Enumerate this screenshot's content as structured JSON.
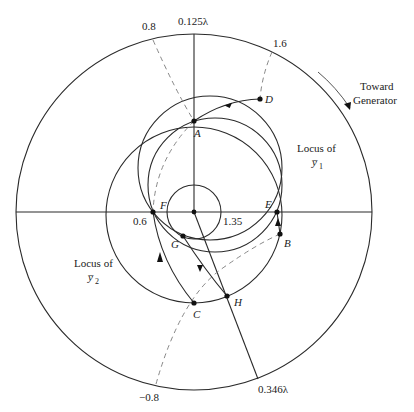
{
  "figure": {
    "type": "smith-chart-double-stub-diagram",
    "top_wavelength_label": "0.125λ",
    "bottom_wavelength_label": "0.346λ",
    "scale_labels": {
      "top_left": "0.8",
      "top_right": "1.6",
      "bottom_left": "−0.8",
      "center_left": "0.6",
      "center_right": "1.35"
    },
    "direction_note": {
      "line1": "Toward",
      "line2": "Generator"
    },
    "locus_y1": {
      "line1": "Locus of",
      "line2": "y̅",
      "sub": "1"
    },
    "locus_y2": {
      "line1": "Locus of",
      "line2": "y̅",
      "sub": "2"
    },
    "points": {
      "A": "A",
      "B": "B",
      "C": "C",
      "D": "D",
      "E": "E",
      "F": "F",
      "G": "G",
      "H": "H"
    }
  }
}
